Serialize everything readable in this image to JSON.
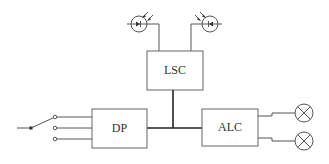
{
  "diagram": {
    "type": "block-diagram",
    "blocks": [
      {
        "id": "lsc",
        "label": "LSC"
      },
      {
        "id": "dp",
        "label": "DP"
      },
      {
        "id": "alc",
        "label": "ALC"
      }
    ],
    "components": {
      "photodiodes": [
        {
          "id": "photodiode-left",
          "symbol": "photodiode-icon",
          "connects_to": "LSC"
        },
        {
          "id": "photodiode-right",
          "symbol": "photodiode-icon",
          "connects_to": "LSC"
        }
      ],
      "switch": {
        "id": "selector-switch",
        "symbol": "switch-icon",
        "positions": 3,
        "connects_to": "DP"
      },
      "lamps": [
        {
          "id": "lamp-top",
          "symbol": "lamp-icon",
          "connects_to": "ALC"
        },
        {
          "id": "lamp-bottom",
          "symbol": "lamp-icon",
          "connects_to": "ALC"
        }
      ]
    },
    "connections": [
      {
        "from": "photodiode-left",
        "to": "LSC"
      },
      {
        "from": "photodiode-right",
        "to": "LSC"
      },
      {
        "from": "selector-switch",
        "to": "DP",
        "lines": 3
      },
      {
        "from": "DP",
        "to": "ALC",
        "via": "bus"
      },
      {
        "from": "LSC",
        "to": "bus"
      },
      {
        "from": "ALC",
        "to": "lamp-top"
      },
      {
        "from": "ALC",
        "to": "lamp-bottom"
      }
    ]
  }
}
